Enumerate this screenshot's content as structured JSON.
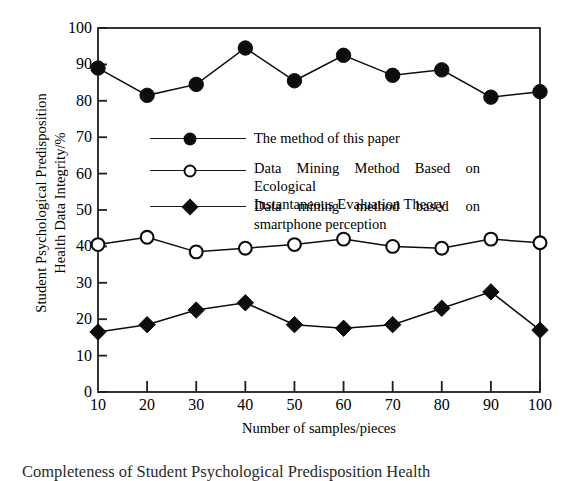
{
  "chart_data": {
    "type": "line",
    "title": "",
    "xlabel": "Number of samples/pieces",
    "ylabel": "Student Psychological Predisposition Health Data Integrity/%",
    "ylabel_line1": "Student Psychological Predisposition",
    "ylabel_line2": "Health Data Integrity/%",
    "x": [
      10,
      20,
      30,
      40,
      50,
      60,
      70,
      80,
      90,
      100
    ],
    "xticklabels": [
      "10",
      "20",
      "30",
      "40",
      "50",
      "60",
      "70",
      "80",
      "90",
      "100"
    ],
    "yticklabels": [
      "0",
      "10",
      "20",
      "30",
      "40",
      "50",
      "60",
      "70",
      "80",
      "90",
      "100"
    ],
    "xlim": [
      10,
      100
    ],
    "ylim": [
      0,
      100
    ],
    "grid": false,
    "legend_position": "center-left-inside",
    "series": [
      {
        "name": "The method of this paper",
        "marker": "filled-circle",
        "color": "#0d0d0d",
        "values": [
          89,
          81.5,
          84.5,
          94.5,
          85.5,
          92.5,
          87,
          88.5,
          81,
          82.5
        ]
      },
      {
        "name": "Data Mining Method Based on Ecological Instantaneous Evaluation Theory",
        "name_line1": "Data Mining Method Based on Ecological",
        "name_line2": "Instantaneous Evaluation Theory",
        "marker": "open-circle",
        "color": "#0d0d0d",
        "values": [
          40.5,
          42.5,
          38.5,
          39.5,
          40.5,
          42,
          40,
          39.5,
          42,
          41
        ]
      },
      {
        "name": "Data mining method based on smartphone perception",
        "name_line1": "Data mining method based on",
        "name_line2": "smartphone perception",
        "marker": "filled-diamond",
        "color": "#0d0d0d",
        "values": [
          16.5,
          18.5,
          22.5,
          24.5,
          18.5,
          17.5,
          18.5,
          23,
          27.5,
          17
        ]
      }
    ]
  },
  "caption": {
    "text": "Completeness of Student Psychological Predisposition Health"
  }
}
